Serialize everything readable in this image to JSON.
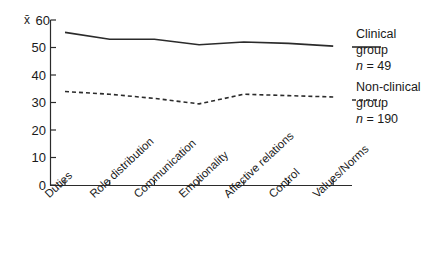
{
  "chart_data": {
    "type": "line",
    "title": "",
    "xlabel": "",
    "ylabel": "x̄",
    "ylim": [
      0,
      60
    ],
    "yticks": [
      0,
      10,
      20,
      30,
      40,
      50,
      60
    ],
    "grid": false,
    "legend_position": "right",
    "categories": [
      "Duties",
      "Role distribution",
      "Communication",
      "Emotionality",
      "Affective relations",
      "Control",
      "Values/Norms"
    ],
    "series": [
      {
        "name": "Clinical group",
        "n_label": "n = 49",
        "style": "solid",
        "color": "#2b2b2b",
        "values": [
          55.5,
          53.0,
          53.0,
          51.0,
          52.0,
          51.5,
          50.5
        ]
      },
      {
        "name": "Non-clinical group",
        "n_label": "n = 190",
        "style": "dashed",
        "color": "#2b2b2b",
        "values": [
          34.0,
          33.0,
          31.5,
          29.5,
          33.0,
          32.5,
          32.0
        ]
      }
    ]
  },
  "axis": {
    "y_symbol": "x̄",
    "tick_labels": [
      "60",
      "50",
      "40",
      "30",
      "20",
      "10",
      "0"
    ]
  },
  "legend": {
    "entries": [
      {
        "name_line1": "Clinical",
        "name_line2": "group",
        "n_prefix": "n",
        "n_value": "= 49"
      },
      {
        "name_line1": "Non-clinical",
        "name_line2": "group",
        "n_prefix": "n",
        "n_value": "= 190"
      }
    ]
  }
}
